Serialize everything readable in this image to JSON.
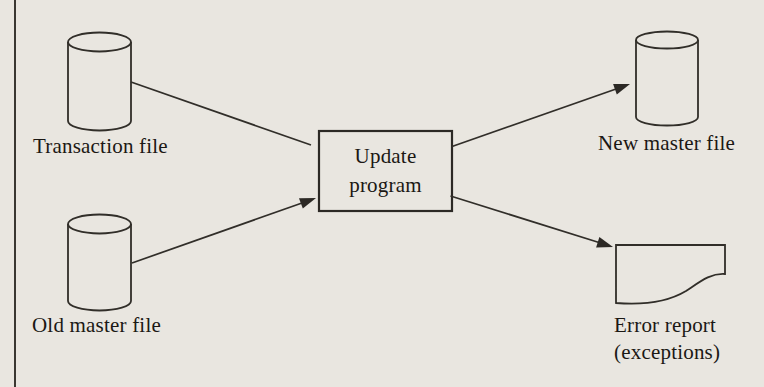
{
  "figure": {
    "type": "system-flowchart",
    "colors": {
      "background": "#e9e6e0",
      "ink": "#2c2925",
      "text": "#1b1814",
      "margin_rule": "#3a3731"
    },
    "nodes": {
      "transaction_file": {
        "shape": "cylinder",
        "label": "Transaction file"
      },
      "old_master_file": {
        "shape": "cylinder",
        "label": "Old master file"
      },
      "update_program": {
        "shape": "rectangle",
        "label_line1": "Update",
        "label_line2": "program"
      },
      "new_master_file": {
        "shape": "cylinder",
        "label": "New master file"
      },
      "error_report": {
        "shape": "document",
        "label_line1": "Error report",
        "label_line2": "(exceptions)"
      }
    },
    "edges": [
      {
        "from": "transaction_file",
        "to": "update_program",
        "arrowhead": false
      },
      {
        "from": "old_master_file",
        "to": "update_program",
        "arrowhead": true
      },
      {
        "from": "update_program",
        "to": "new_master_file",
        "arrowhead": true
      },
      {
        "from": "update_program",
        "to": "error_report",
        "arrowhead": true
      }
    ]
  }
}
